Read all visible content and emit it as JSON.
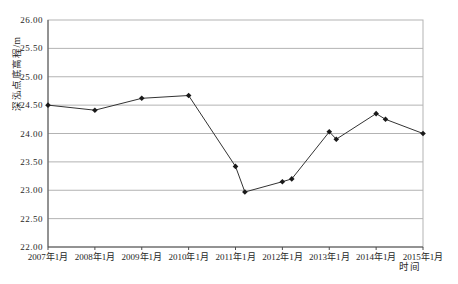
{
  "page": {
    "background_color": "#ffffff"
  },
  "chart_data": {
    "type": "line",
    "title": "",
    "xlabel": "时间",
    "ylabel": "深泓点底高程/m",
    "xlim": [
      2007,
      2015
    ],
    "ylim": [
      22.0,
      26.0
    ],
    "grid": "horizontal",
    "legend": "none",
    "x_ticks": [
      {
        "value": 2007,
        "label": "2007年1月"
      },
      {
        "value": 2008,
        "label": "2008年1月"
      },
      {
        "value": 2009,
        "label": "2009年1月"
      },
      {
        "value": 2010,
        "label": "2010年1月"
      },
      {
        "value": 2011,
        "label": "2011年1月"
      },
      {
        "value": 2012,
        "label": "2012年1月"
      },
      {
        "value": 2013,
        "label": "2013年1月"
      },
      {
        "value": 2014,
        "label": "2014年1月"
      },
      {
        "value": 2015,
        "label": "2015年1月"
      }
    ],
    "y_ticks": [
      {
        "value": 22.0,
        "label": "22.00"
      },
      {
        "value": 22.5,
        "label": "22.50"
      },
      {
        "value": 23.0,
        "label": "23.00"
      },
      {
        "value": 23.5,
        "label": "23.50"
      },
      {
        "value": 24.0,
        "label": "24.00"
      },
      {
        "value": 24.5,
        "label": "24.50"
      },
      {
        "value": 25.0,
        "label": "25.00"
      },
      {
        "value": 25.5,
        "label": "25.50"
      },
      {
        "value": 26.0,
        "label": "26.00"
      }
    ],
    "series": [
      {
        "name": "深泓点底高程",
        "marker": "diamond",
        "points": [
          {
            "x": 2007.0,
            "y": 24.5
          },
          {
            "x": 2008.0,
            "y": 24.41
          },
          {
            "x": 2009.0,
            "y": 24.62
          },
          {
            "x": 2010.0,
            "y": 24.67
          },
          {
            "x": 2011.0,
            "y": 23.42
          },
          {
            "x": 2011.2,
            "y": 22.97
          },
          {
            "x": 2012.0,
            "y": 23.15
          },
          {
            "x": 2012.2,
            "y": 23.2
          },
          {
            "x": 2013.0,
            "y": 24.03
          },
          {
            "x": 2013.15,
            "y": 23.9
          },
          {
            "x": 2014.0,
            "y": 24.35
          },
          {
            "x": 2014.2,
            "y": 24.25
          },
          {
            "x": 2015.0,
            "y": 24.0
          }
        ]
      }
    ]
  },
  "style": {
    "line_color": "#333333",
    "marker_color": "#1a1a1a",
    "grid_color": "#b3b3b3",
    "frame_color": "#b3b3b3",
    "axis_color": "#4d4d4d",
    "text_color": "#262626"
  }
}
